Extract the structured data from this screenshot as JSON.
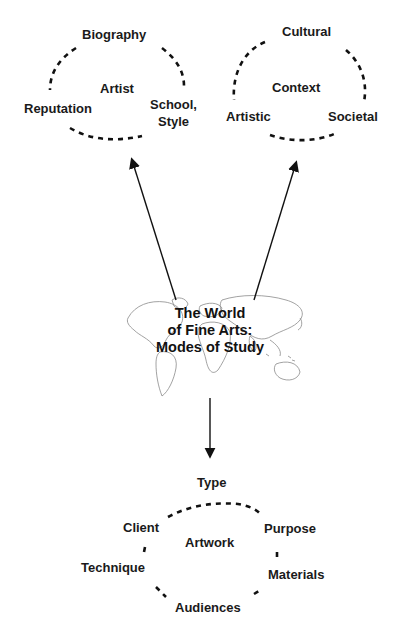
{
  "center": {
    "title_line1": "The World",
    "title_line2": "of Fine Arts:",
    "title_line3": "Modes of Study",
    "background": "world-map-outline"
  },
  "artist_cycle": {
    "center_label": "Artist",
    "top": "Biography",
    "left": "Reputation",
    "right_line1": "School,",
    "right_line2": "Style"
  },
  "context_cycle": {
    "center_label": "Context",
    "top": "Cultural",
    "left": "Artistic",
    "right": "Societal"
  },
  "artwork_cycle": {
    "center_label": "Artwork",
    "top": "Type",
    "upper_left": "Client",
    "upper_right": "Purpose",
    "lower_left": "Technique",
    "lower_right": "Materials",
    "bottom": "Audiences"
  },
  "colors": {
    "ink": "#111111",
    "map_line": "#8a8a8a",
    "background": "#ffffff"
  }
}
